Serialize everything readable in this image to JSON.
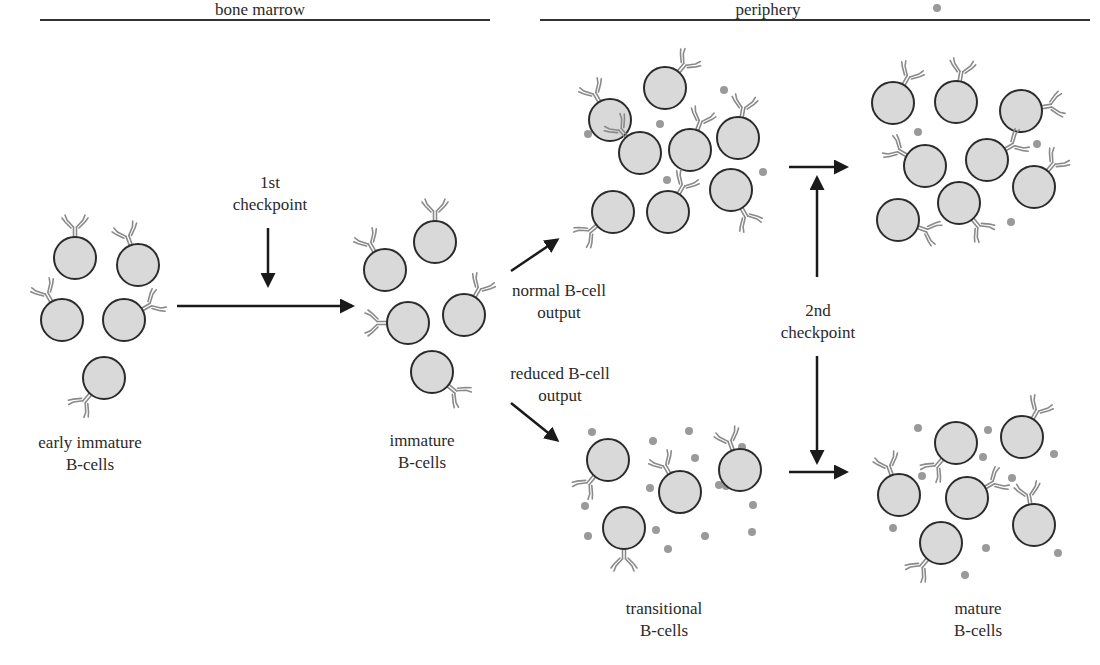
{
  "regions": {
    "left": {
      "label": "bone marrow",
      "line": [
        40,
        490
      ],
      "label_x": 260
    },
    "right": {
      "label": "periphery",
      "line": [
        540,
        1090
      ],
      "label_x": 768
    }
  },
  "colors": {
    "cell_fill": "#d9d9d9",
    "cell_stroke": "#2b2b2b",
    "antibody": "#8a8a8a",
    "dot": "#9a9a9a",
    "arrow": "#1a1a1a",
    "line": "#333333"
  },
  "labels": {
    "early_immature": {
      "line1": "early immature",
      "line2": "B-cells"
    },
    "checkpoint1": {
      "line1": "1st",
      "line2": "checkpoint"
    },
    "immature": {
      "line1": "immature",
      "line2": "B-cells"
    },
    "normal_output": {
      "line1": "normal B-cell",
      "line2": "output"
    },
    "reduced_output": {
      "line1": "reduced B-cell",
      "line2": "output"
    },
    "checkpoint2": {
      "line1": "2nd",
      "line2": "checkpoint"
    },
    "transitional": {
      "line1": "transitional",
      "line2": "B-cells"
    },
    "mature": {
      "line1": "mature",
      "line2": "B-cells"
    }
  },
  "groups": [
    {
      "name": "early-immature-cells",
      "cells": [
        [
          75,
          258,
          0
        ],
        [
          138,
          265,
          -20
        ],
        [
          62,
          320,
          -30
        ],
        [
          124,
          320,
          60
        ],
        [
          104,
          378,
          220
        ]
      ],
      "dots": []
    },
    {
      "name": "immature-cells",
      "cells": [
        [
          385,
          270,
          -30
        ],
        [
          435,
          242,
          0
        ],
        [
          408,
          323,
          -90
        ],
        [
          464,
          315,
          30
        ],
        [
          432,
          372,
          130
        ]
      ],
      "dots": []
    },
    {
      "name": "normal-periphery-cells",
      "cells": [
        [
          610,
          120,
          -30
        ],
        [
          665,
          88,
          40
        ],
        [
          640,
          153,
          -40
        ],
        [
          690,
          150,
          20
        ],
        [
          738,
          138,
          10
        ],
        [
          613,
          212,
          230
        ],
        [
          668,
          212,
          30
        ],
        [
          731,
          190,
          150
        ]
      ],
      "dots": [
        [
          588,
          134
        ],
        [
          660,
          124
        ],
        [
          667,
          180
        ],
        [
          763,
          172
        ],
        [
          724,
          90
        ]
      ]
    },
    {
      "name": "mature-normal-cells",
      "cells": [
        [
          893,
          103,
          30
        ],
        [
          956,
          102,
          10
        ],
        [
          1021,
          111,
          80
        ],
        [
          925,
          166,
          -60
        ],
        [
          987,
          160,
          60
        ],
        [
          1034,
          187,
          40
        ],
        [
          898,
          220,
          110
        ],
        [
          959,
          203,
          140
        ]
      ],
      "dots": [
        [
          937,
          8
        ],
        [
          918,
          132
        ],
        [
          1037,
          144
        ],
        [
          1011,
          222
        ]
      ]
    },
    {
      "name": "transitional-cells",
      "cells": [
        [
          608,
          460,
          220
        ],
        [
          680,
          492,
          -30
        ],
        [
          740,
          470,
          -20
        ],
        [
          624,
          528,
          180
        ]
      ],
      "dots": [
        [
          592,
          432
        ],
        [
          653,
          441
        ],
        [
          689,
          431
        ],
        [
          695,
          458
        ],
        [
          650,
          488
        ],
        [
          585,
          506
        ],
        [
          656,
          530
        ],
        [
          588,
          536
        ],
        [
          668,
          549
        ],
        [
          705,
          536
        ],
        [
          719,
          485
        ],
        [
          753,
          505
        ],
        [
          742,
          447
        ],
        [
          752,
          532
        ],
        [
          726,
          486
        ]
      ]
    },
    {
      "name": "mature-reduced-cells",
      "cells": [
        [
          956,
          443,
          220
        ],
        [
          1022,
          437,
          30
        ],
        [
          899,
          495,
          -20
        ],
        [
          967,
          498,
          60
        ],
        [
          1034,
          525,
          -10
        ],
        [
          941,
          543,
          220
        ]
      ],
      "dots": [
        [
          918,
          428
        ],
        [
          988,
          430
        ],
        [
          983,
          457
        ],
        [
          922,
          476
        ],
        [
          1012,
          478
        ],
        [
          1054,
          454
        ],
        [
          893,
          528
        ],
        [
          986,
          548
        ],
        [
          965,
          575
        ],
        [
          1058,
          553
        ]
      ]
    }
  ],
  "arrows": [
    {
      "name": "bone-marrow-arrow",
      "from": [
        177,
        306
      ],
      "to": [
        352,
        306
      ]
    },
    {
      "name": "checkpoint1-arrow",
      "from": [
        268,
        228
      ],
      "to": [
        268,
        285
      ]
    },
    {
      "name": "normal-output-arrow",
      "from": [
        511,
        271
      ],
      "to": [
        557,
        240
      ]
    },
    {
      "name": "reduced-output-arrow",
      "from": [
        511,
        403
      ],
      "to": [
        557,
        440
      ]
    },
    {
      "name": "normal-to-mature-arrow",
      "from": [
        789,
        167
      ],
      "to": [
        846,
        167
      ]
    },
    {
      "name": "reduced-to-mature-arrow",
      "from": [
        789,
        472
      ],
      "to": [
        846,
        472
      ]
    },
    {
      "name": "checkpoint2-up-arrow",
      "from": [
        817,
        277
      ],
      "to": [
        817,
        178
      ]
    },
    {
      "name": "checkpoint2-down-arrow",
      "from": [
        817,
        356
      ],
      "to": [
        817,
        462
      ]
    }
  ]
}
